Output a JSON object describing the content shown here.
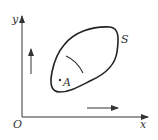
{
  "diagram": {
    "axes": {
      "x_label": "x",
      "y_label": "y",
      "origin_label": "O"
    },
    "surface_label": "S",
    "point_label": "A",
    "arrows": [
      {
        "name": "up-arrow",
        "direction": "up"
      },
      {
        "name": "right-arrow",
        "direction": "right"
      }
    ],
    "colors": {
      "stroke": "#333333",
      "background": "#ffffff"
    }
  }
}
